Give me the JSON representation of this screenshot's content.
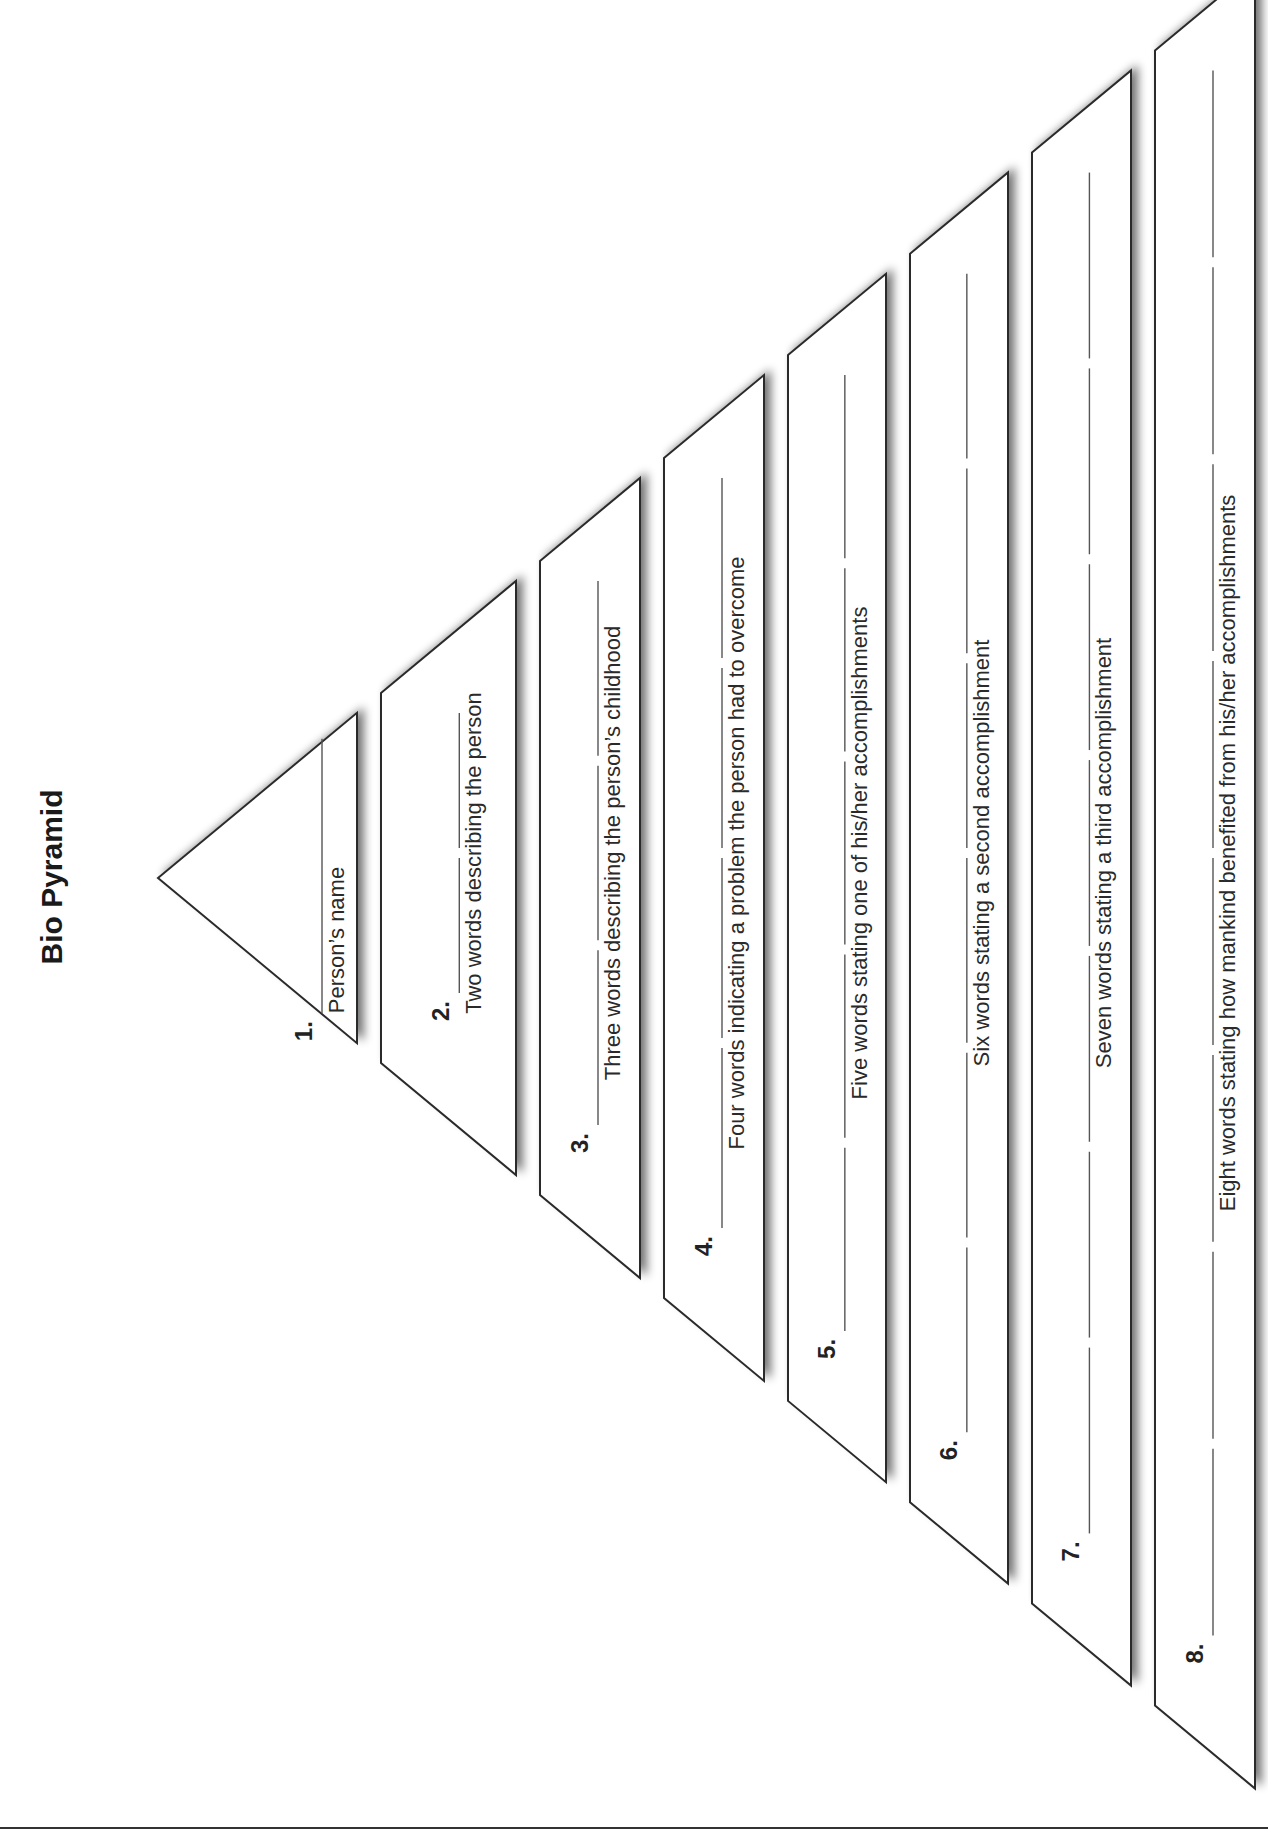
{
  "document": {
    "title": "Bio Pyramid",
    "colors": {
      "ink": "#2b2b2b",
      "paper": "#ffffff",
      "shadow": "#9a9a9a"
    }
  },
  "pyramid": {
    "rows": [
      {
        "number": "1.",
        "words": 1,
        "prompt": "Person’s name"
      },
      {
        "number": "2.",
        "words": 2,
        "prompt": "Two words describing the person"
      },
      {
        "number": "3.",
        "words": 3,
        "prompt": "Three words describing the person’s childhood"
      },
      {
        "number": "4.",
        "words": 4,
        "prompt": "Four words indicating a problem the person had to overcome"
      },
      {
        "number": "5.",
        "words": 5,
        "prompt": "Five words stating one of his/her accomplishments"
      },
      {
        "number": "6.",
        "words": 6,
        "prompt": "Six words stating a second accomplishment"
      },
      {
        "number": "7.",
        "words": 7,
        "prompt": "Seven words stating a third accomplishment"
      },
      {
        "number": "8.",
        "words": 8,
        "prompt": "Eight words stating how mankind benefited from his/her accomplishments"
      }
    ]
  }
}
